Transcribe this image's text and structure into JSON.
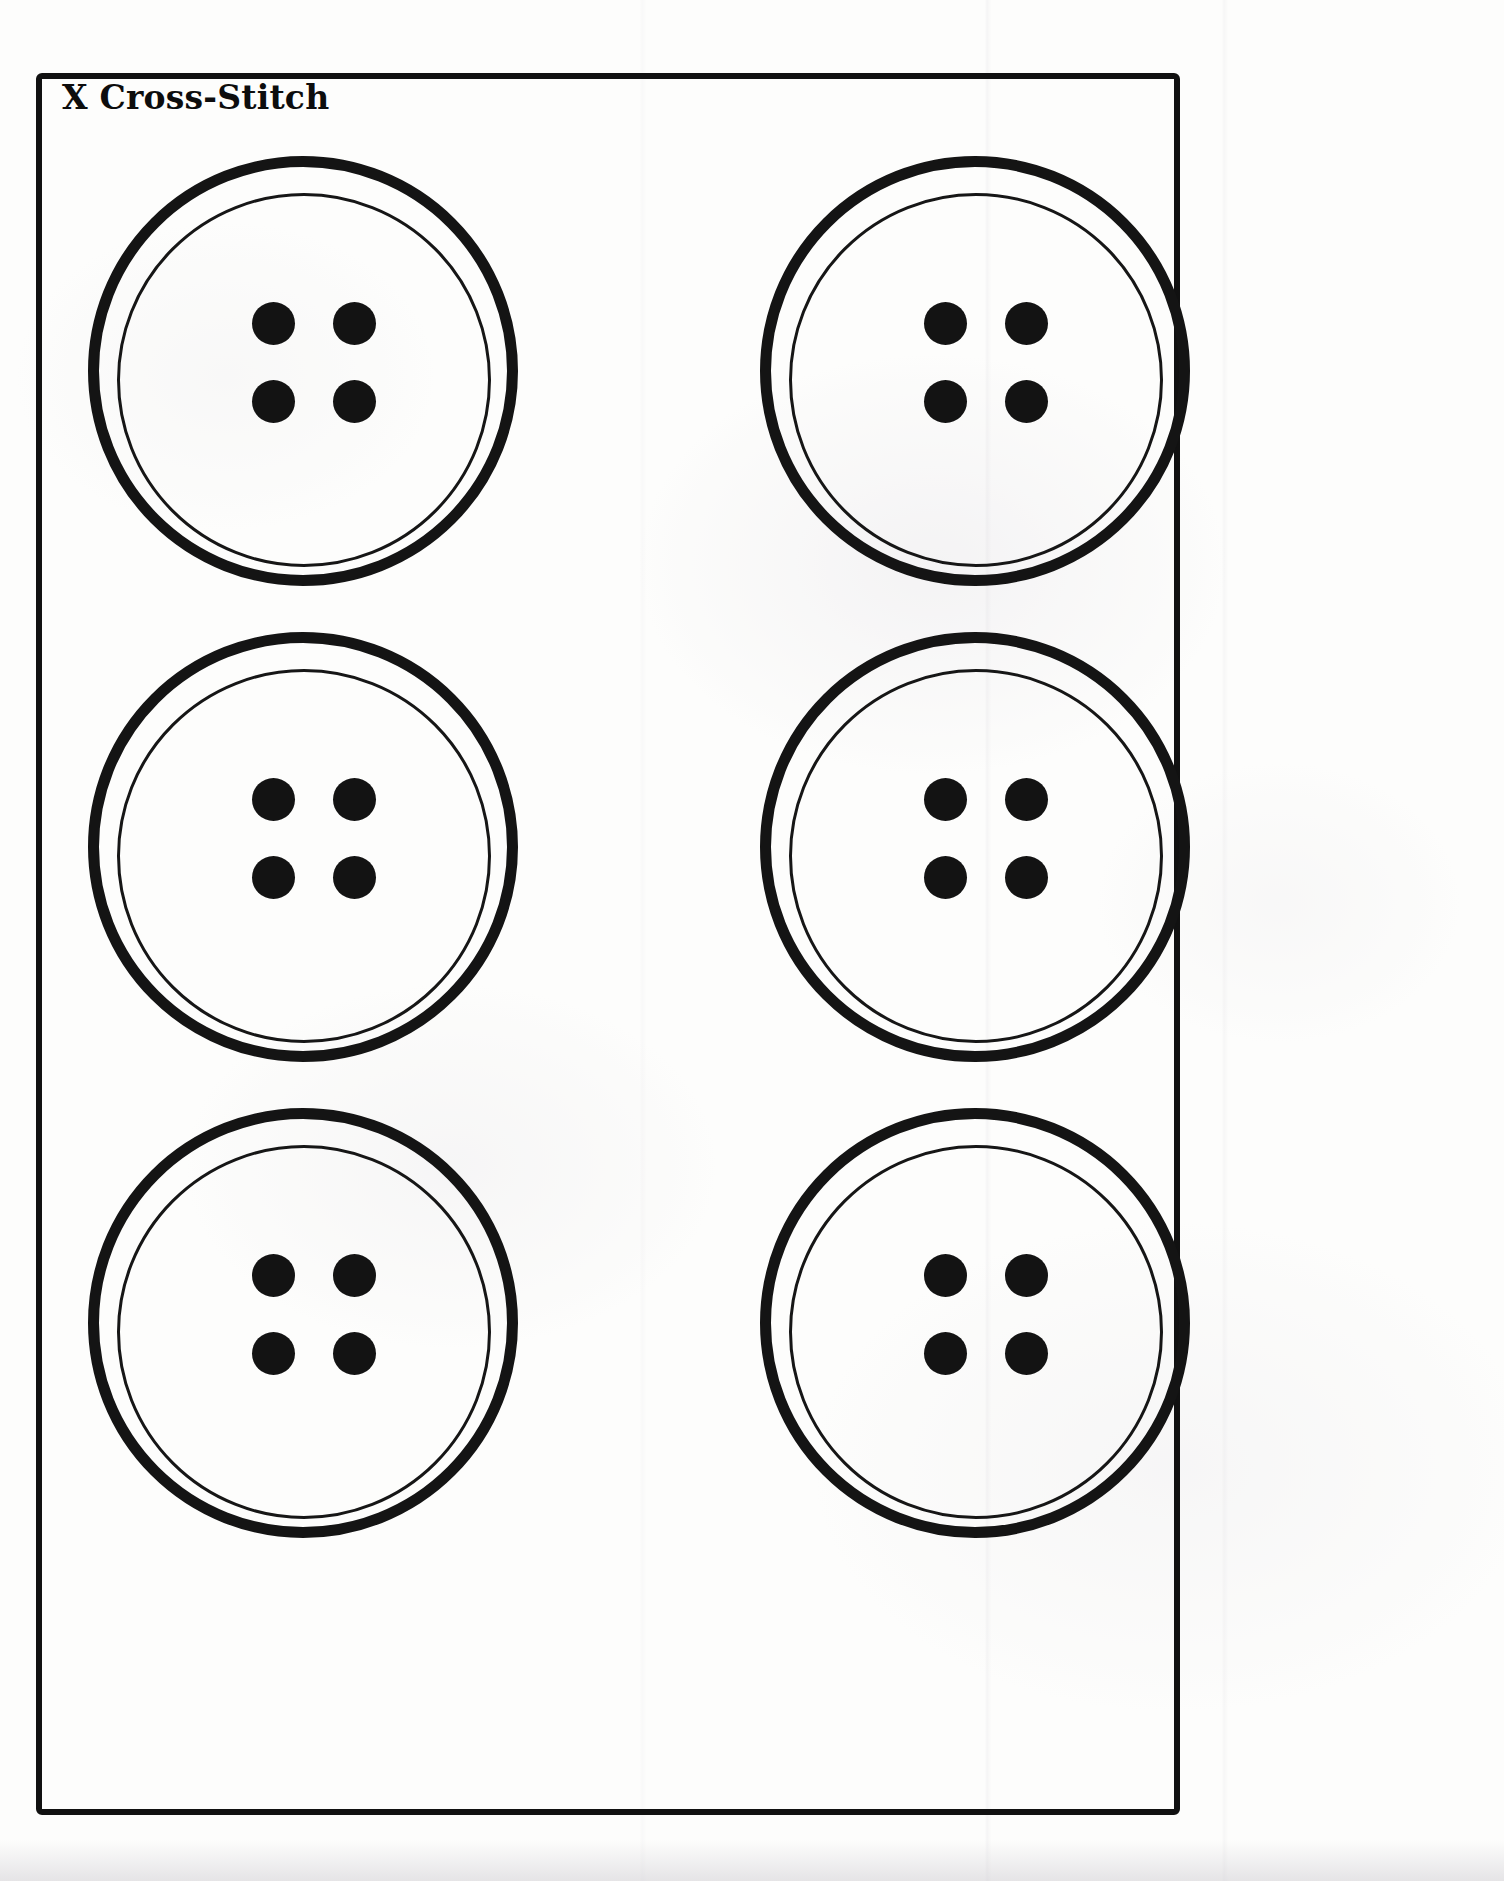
{
  "document": {
    "title": "X Cross-Stitch",
    "media": "scanned paper worksheet",
    "frame_color": "#111111",
    "paper_color": "#fdfdfc",
    "ink_color": "#131313"
  },
  "grid": {
    "rows": 3,
    "columns": 2,
    "total_items": 6
  },
  "buttons": [
    {
      "id": "button-r1c1",
      "label": "Button 1",
      "row": 1,
      "column": 1,
      "hole_count": 4,
      "hole_labels": [
        "top-left hole",
        "top-right hole",
        "bottom-left hole",
        "bottom-right hole"
      ]
    },
    {
      "id": "button-r1c2",
      "label": "Button 2",
      "row": 1,
      "column": 2,
      "hole_count": 4,
      "hole_labels": [
        "top-left hole",
        "top-right hole",
        "bottom-left hole",
        "bottom-right hole"
      ]
    },
    {
      "id": "button-r2c1",
      "label": "Button 3",
      "row": 2,
      "column": 1,
      "hole_count": 4,
      "hole_labels": [
        "top-left hole",
        "top-right hole",
        "bottom-left hole",
        "bottom-right hole"
      ]
    },
    {
      "id": "button-r2c2",
      "label": "Button 4",
      "row": 2,
      "column": 2,
      "hole_count": 4,
      "hole_labels": [
        "top-left hole",
        "top-right hole",
        "bottom-left hole",
        "bottom-right hole"
      ]
    },
    {
      "id": "button-r3c1",
      "label": "Button 5",
      "row": 3,
      "column": 1,
      "hole_count": 4,
      "hole_labels": [
        "top-left hole",
        "top-right hole",
        "bottom-left hole",
        "bottom-right hole"
      ]
    },
    {
      "id": "button-r3c2",
      "label": "Button 6",
      "row": 3,
      "column": 2,
      "hole_count": 4,
      "hole_labels": [
        "top-left hole",
        "top-right hole",
        "bottom-left hole",
        "bottom-right hole"
      ]
    }
  ]
}
